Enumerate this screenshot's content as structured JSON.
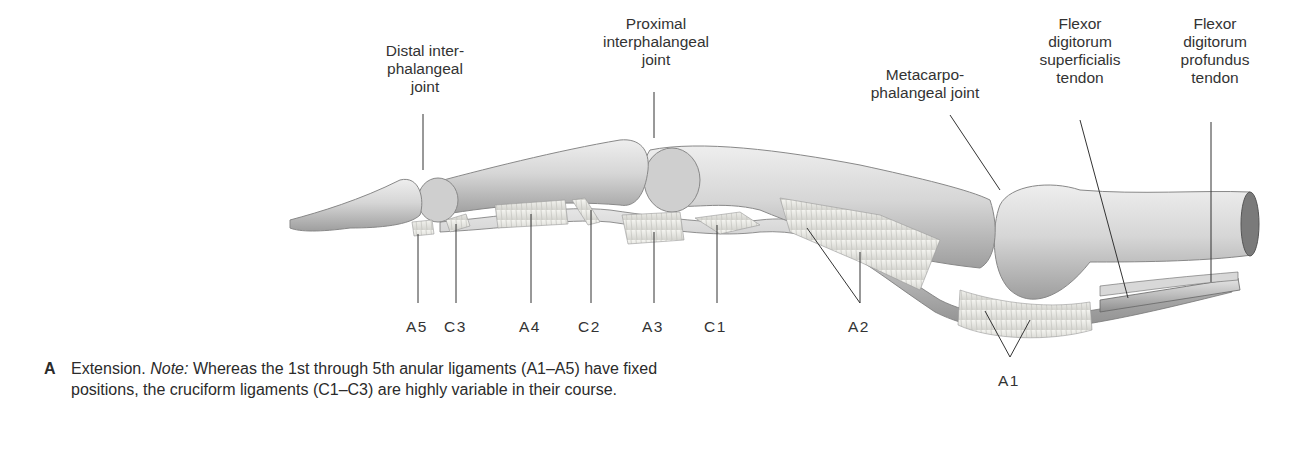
{
  "figure": {
    "view": "Extension",
    "top_labels": [
      {
        "id": "dip",
        "text": "Distal inter-\nphalangeal\njoint"
      },
      {
        "id": "pip",
        "text": "Proximal\ninterphalangeal\njoint"
      },
      {
        "id": "mcp",
        "text": "Metacarpo-\nphalangeal joint"
      },
      {
        "id": "fds",
        "text": "Flexor\ndigitorum\nsuperficialis\ntendon"
      },
      {
        "id": "fdp",
        "text": "Flexor\ndigitorum\nprofundus\ntendon"
      }
    ],
    "bottom_labels": [
      {
        "id": "a5",
        "text": "A5"
      },
      {
        "id": "c3",
        "text": "C3"
      },
      {
        "id": "a4",
        "text": "A4"
      },
      {
        "id": "c2",
        "text": "C2"
      },
      {
        "id": "a3",
        "text": "A3"
      },
      {
        "id": "c1",
        "text": "C1"
      },
      {
        "id": "a2",
        "text": "A2"
      },
      {
        "id": "a1",
        "text": "A1"
      }
    ],
    "colors": {
      "bone": "#d9d9d9",
      "bone_shadow": "#a8a8a8",
      "ligament": "#ebebe6",
      "tendon": "#c9c9c9",
      "leader_line": "#333333"
    }
  },
  "caption": {
    "letter": "A",
    "lead": "Extension.",
    "note_label": "Note:",
    "text": "Whereas the 1st through 5th anular ligaments (A1–A5) have fixed positions, the cruciform ligaments (C1–C3) are highly variable in their course."
  }
}
